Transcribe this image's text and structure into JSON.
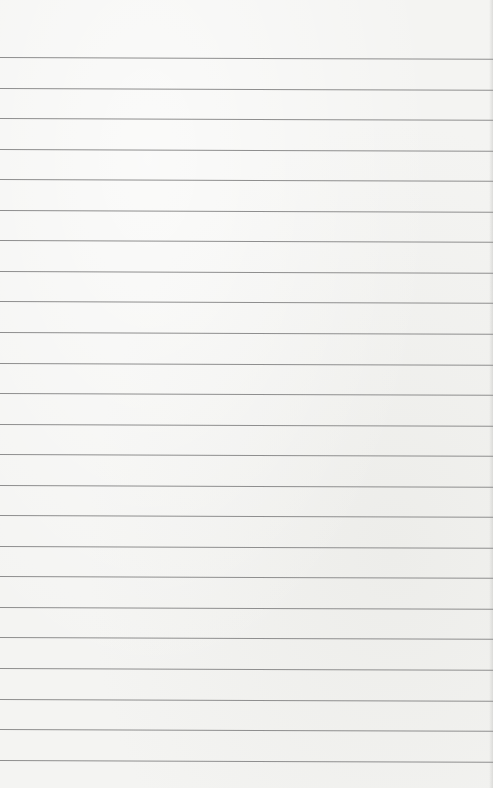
{
  "image": {
    "description": "Blank sheet of ruled notebook paper",
    "background_color": "#f4f4f2",
    "rule_color": "#8e8e8e",
    "rules": {
      "count": 24,
      "first_y": 57,
      "spacing": 30.55
    }
  }
}
